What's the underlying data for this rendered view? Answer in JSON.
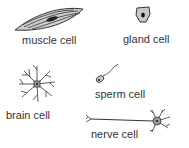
{
  "diagram": {
    "title": "",
    "cells": [
      {
        "id": "muscle",
        "label": "muscle cell"
      },
      {
        "id": "gland",
        "label": "gland cell"
      },
      {
        "id": "brain",
        "label": "brain cell"
      },
      {
        "id": "sperm",
        "label": "sperm cell"
      },
      {
        "id": "nerve",
        "label": "nerve cell"
      }
    ],
    "colors": {
      "outline": "#333333",
      "fill": "#c8c8c8",
      "nucleus": "#222222",
      "text": "#333333"
    }
  }
}
